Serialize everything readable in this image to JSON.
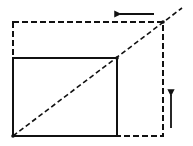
{
  "diagram": {
    "type": "proportional-scaling",
    "background": "#ffffff",
    "stroke_color": "#111111",
    "original_rect": {
      "x": 13,
      "y": 58,
      "width": 104,
      "height": 78,
      "style": "solid"
    },
    "scaled_rect": {
      "x": 13,
      "y": 22,
      "width": 150,
      "height": 114,
      "style": "dashed"
    },
    "diagonal": {
      "x1": 13,
      "y1": 136,
      "x2": 182,
      "y2": 8,
      "style": "dashed"
    },
    "arrows": [
      {
        "name": "left-arrow",
        "direction": "left",
        "x1": 154,
        "y1": 14,
        "x2": 120,
        "y2": 14
      },
      {
        "name": "up-arrow",
        "direction": "up",
        "x1": 171,
        "y1": 128,
        "x2": 171,
        "y2": 95
      }
    ]
  }
}
